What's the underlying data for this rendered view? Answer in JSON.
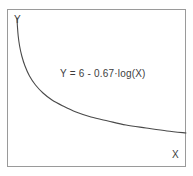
{
  "chart_data": {
    "type": "line",
    "title": "",
    "subtitle": "",
    "xlabel": "X",
    "ylabel": "Y",
    "annotation": "Y = 6 - 0.67·log(X)",
    "equation": "Y = 6 - 0.67·log(X)",
    "intercept": 6,
    "coefficient": -0.67,
    "transform": "log(X)",
    "grid": false,
    "legend": null,
    "legend_position": "none",
    "tick_labels_x": [],
    "tick_labels_y": [],
    "xlim": [
      0,
      1
    ],
    "ylim": [
      0,
      6
    ],
    "series": [
      {
        "name": "Y = 6 - 0.67·log(X)",
        "color": "#4a4a4a",
        "x": [
          0.055,
          0.06,
          0.07,
          0.08,
          0.09,
          0.1,
          0.12,
          0.15,
          0.19,
          0.24,
          0.3,
          0.38,
          0.47,
          0.57,
          0.68,
          0.8,
          0.93,
          1.0
        ],
        "y": [
          6.0,
          5.4,
          4.6,
          4.0,
          3.58,
          3.26,
          2.82,
          2.4,
          2.05,
          1.78,
          1.57,
          1.38,
          1.23,
          1.1,
          0.99,
          0.89,
          0.8,
          0.76
        ]
      }
    ],
    "curve_points_px": [
      [
        17,
        18
      ],
      [
        17.4,
        26
      ],
      [
        18.2,
        36
      ],
      [
        19.6,
        46
      ],
      [
        21.8,
        56
      ],
      [
        25,
        66
      ],
      [
        29.5,
        76
      ],
      [
        35.5,
        85
      ],
      [
        43,
        93
      ],
      [
        52,
        100
      ],
      [
        63,
        106
      ],
      [
        76,
        112
      ],
      [
        91,
        117
      ],
      [
        108,
        121
      ],
      [
        126,
        125
      ],
      [
        146,
        128
      ],
      [
        167,
        131
      ],
      [
        186,
        133
      ]
    ]
  },
  "figure": {
    "background_color": "#ffffff",
    "frame_color": "#9a9a9a",
    "curve_color": "#4a4a4a",
    "text_color": "#3d3d3d"
  },
  "labels": {
    "y_axis": "Y",
    "x_axis": "X"
  }
}
